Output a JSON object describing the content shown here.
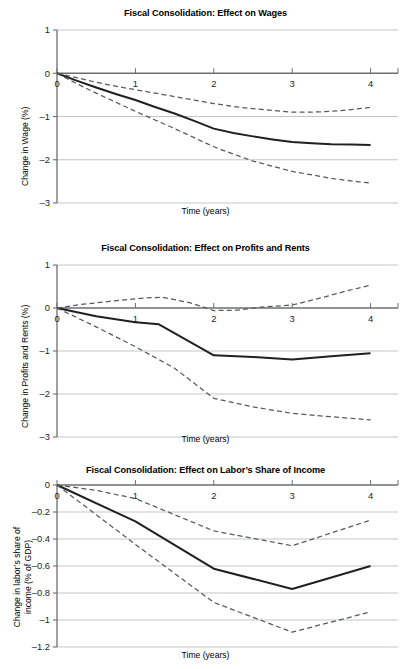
{
  "figure": {
    "xlabel": "Time (years)",
    "panels": [
      {
        "title": "Fiscal Consolidation: Effect on Wages",
        "ylabel": "Change in Wage (%)",
        "ylabel_lines": [
          "Change in Wage (%)"
        ],
        "yticks": [
          "1",
          "0",
          "–1",
          "–2",
          "–3"
        ],
        "xticks": [
          "0",
          "1",
          "2",
          "3",
          "4"
        ]
      },
      {
        "title": "Fiscal Consolidation: Effect on Profits and Rents",
        "ylabel": "Change in Profits and Rents (%)",
        "ylabel_lines": [
          "Change in Profits and Rents (%)"
        ],
        "yticks": [
          "1",
          "0",
          "–1",
          "–2",
          "–3"
        ],
        "xticks": [
          "0",
          "1",
          "2",
          "3",
          "4"
        ]
      },
      {
        "title": "Fiscal Consolidation: Effect on Labor’s Share of Income",
        "ylabel": "Change in labor’s share of income (% of GDP)",
        "ylabel_lines": [
          "Change in labor’s share of",
          "income (% of GDP)"
        ],
        "yticks": [
          "0",
          "–0.2",
          "–0.4",
          "–0.6",
          "–0.8",
          "–1",
          "–1.2"
        ],
        "xticks": [
          "0",
          "2",
          "3",
          "4"
        ]
      }
    ]
  },
  "colors": {
    "line": "#231f20",
    "grid": "#bcbec0",
    "axis": "#6d6e71",
    "band": "#58595b",
    "text": "#231f20"
  },
  "chart_data": [
    {
      "type": "line",
      "title": "Fiscal Consolidation: Effect on Wages",
      "xlabel": "Time (years)",
      "ylabel": "Change in Wage (%)",
      "xlim": [
        0,
        4.35
      ],
      "ylim": [
        -3,
        1
      ],
      "xticks": [
        0,
        1,
        2,
        3,
        4
      ],
      "yticks": [
        1,
        0,
        -1,
        -2,
        -3
      ],
      "grid": true,
      "legend": "none",
      "series": [
        {
          "name": "Point estimate",
          "style": "solid",
          "x": [
            0,
            0.25,
            0.5,
            0.75,
            1,
            1.25,
            1.5,
            1.75,
            2,
            2.25,
            2.5,
            2.75,
            3,
            3.25,
            3.5,
            3.75,
            4
          ],
          "values": [
            0,
            -0.17,
            -0.33,
            -0.48,
            -0.62,
            -0.78,
            -0.93,
            -1.1,
            -1.28,
            -1.38,
            -1.46,
            -1.53,
            -1.59,
            -1.62,
            -1.64,
            -1.65,
            -1.66
          ]
        },
        {
          "name": "Upper 90% confidence band",
          "style": "dashed",
          "x": [
            0,
            0.25,
            0.5,
            0.75,
            1,
            1.25,
            1.5,
            1.75,
            2,
            2.25,
            2.5,
            2.75,
            3,
            3.25,
            3.5,
            3.75,
            4
          ],
          "values": [
            0,
            -0.1,
            -0.21,
            -0.3,
            -0.38,
            -0.46,
            -0.54,
            -0.62,
            -0.7,
            -0.77,
            -0.82,
            -0.86,
            -0.9,
            -0.9,
            -0.88,
            -0.84,
            -0.79
          ]
        },
        {
          "name": "Lower 90% confidence band",
          "style": "dashed",
          "x": [
            0,
            0.25,
            0.5,
            0.75,
            1,
            1.25,
            1.5,
            1.75,
            2,
            2.25,
            2.5,
            2.75,
            3,
            3.25,
            3.5,
            3.75,
            4
          ],
          "values": [
            0,
            -0.24,
            -0.46,
            -0.67,
            -0.88,
            -1.08,
            -1.28,
            -1.49,
            -1.7,
            -1.87,
            -2.03,
            -2.15,
            -2.27,
            -2.35,
            -2.43,
            -2.49,
            -2.54
          ]
        }
      ]
    },
    {
      "type": "line",
      "title": "Fiscal Consolidation: Effect on Profits and Rents",
      "xlabel": "Time (years)",
      "ylabel": "Change in Profits and Rents (%)",
      "xlim": [
        0,
        4.35
      ],
      "ylim": [
        -3,
        1
      ],
      "xticks": [
        0,
        1,
        2,
        3,
        4
      ],
      "yticks": [
        1,
        0,
        -1,
        -2,
        -3
      ],
      "grid": true,
      "legend": "none",
      "series": [
        {
          "name": "Point estimate",
          "style": "solid",
          "x": [
            0,
            0.5,
            1,
            1.3,
            2,
            2.5,
            3,
            3.5,
            4
          ],
          "values": [
            0,
            -0.19,
            -0.33,
            -0.38,
            -1.1,
            -1.14,
            -1.2,
            -1.12,
            -1.05
          ]
        },
        {
          "name": "Upper 90% confidence band",
          "style": "dashed",
          "x": [
            0,
            0.3,
            0.7,
            1.1,
            1.35,
            1.7,
            2,
            2.3,
            2.6,
            3,
            3.4,
            3.7,
            4
          ],
          "values": [
            0,
            0.08,
            0.16,
            0.23,
            0.25,
            0.12,
            -0.06,
            -0.05,
            0.02,
            0.07,
            0.25,
            0.4,
            0.53
          ]
        },
        {
          "name": "Lower 90% confidence band",
          "style": "dashed",
          "x": [
            0,
            0.5,
            1,
            1.5,
            2,
            2.5,
            3,
            3.5,
            4
          ],
          "values": [
            0,
            -0.44,
            -0.9,
            -1.4,
            -2.1,
            -2.3,
            -2.45,
            -2.53,
            -2.6
          ]
        }
      ]
    },
    {
      "type": "line",
      "title": "Fiscal Consolidation: Effect on Labor’s Share of Income",
      "xlabel": "Time (years)",
      "ylabel": "Change in labor’s share of income (% of GDP)",
      "xlim": [
        0,
        4.35
      ],
      "ylim": [
        -1.2,
        0
      ],
      "xticks": [
        0,
        1,
        2,
        3,
        4
      ],
      "yticks": [
        0,
        -0.2,
        -0.4,
        -0.6,
        -0.8,
        -1,
        -1.2
      ],
      "grid": true,
      "legend": "none",
      "series": [
        {
          "name": "Point estimate",
          "style": "solid",
          "x": [
            0,
            1,
            2,
            3,
            4
          ],
          "values": [
            0,
            -0.27,
            -0.62,
            -0.77,
            -0.6
          ]
        },
        {
          "name": "Upper 90% confidence band",
          "style": "dashed",
          "x": [
            0,
            0.5,
            1,
            2,
            3,
            4
          ],
          "values": [
            0,
            -0.04,
            -0.1,
            -0.34,
            -0.45,
            -0.26
          ]
        },
        {
          "name": "Lower 90% confidence band",
          "style": "dashed",
          "x": [
            0,
            1,
            2,
            3,
            4
          ],
          "values": [
            0,
            -0.44,
            -0.87,
            -1.09,
            -0.94
          ]
        }
      ]
    }
  ]
}
